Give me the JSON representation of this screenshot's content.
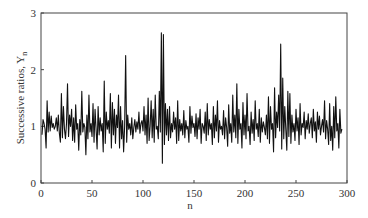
{
  "chart_data": {
    "type": "line",
    "title": "",
    "xlabel": "n",
    "ylabel": "Successive ratios, Y",
    "ylabel_subscript": "n",
    "xlim": [
      0,
      300
    ],
    "ylim": [
      0,
      3
    ],
    "xticks": [
      0,
      50,
      100,
      150,
      200,
      250,
      300
    ],
    "yticks": [
      0,
      1,
      2,
      3
    ],
    "grid": false,
    "legend": null,
    "series": [
      {
        "name": "Y_n",
        "color": "#111111",
        "x_start": 1,
        "x_step": 1,
        "values": [
          0.85,
          1.12,
          1.05,
          0.95,
          0.62,
          1.45,
          0.9,
          1.25,
          0.92,
          1.18,
          0.98,
          1.05,
          0.95,
          1.0,
          1.15,
          0.92,
          1.2,
          0.88,
          0.72,
          1.58,
          0.8,
          1.35,
          0.95,
          0.78,
          1.05,
          1.75,
          0.82,
          1.2,
          1.0,
          1.3,
          0.75,
          1.15,
          0.72,
          1.38,
          0.95,
          1.05,
          0.58,
          1.12,
          0.85,
          1.62,
          0.9,
          1.05,
          0.98,
          0.5,
          1.2,
          0.78,
          1.55,
          0.9,
          1.05,
          0.82,
          1.4,
          0.72,
          1.3,
          0.95,
          0.6,
          1.35,
          0.85,
          1.15,
          0.92,
          1.05,
          0.55,
          1.8,
          0.7,
          1.25,
          0.95,
          1.1,
          0.88,
          1.58,
          0.62,
          1.42,
          0.85,
          1.3,
          0.7,
          1.2,
          0.98,
          1.55,
          0.62,
          1.35,
          0.78,
          1.1,
          0.55,
          1.0,
          2.25,
          0.72,
          1.2,
          0.95,
          1.05,
          0.85,
          1.15,
          0.78,
          0.98,
          1.12,
          0.9,
          1.08,
          0.95,
          1.25,
          0.88,
          1.05,
          1.1,
          0.92,
          1.35,
          0.85,
          1.2,
          0.7,
          1.5,
          0.75,
          1.0,
          1.45,
          0.8,
          1.3,
          0.72,
          1.55,
          0.95,
          1.0,
          0.78,
          1.62,
          0.9,
          2.65,
          0.35,
          2.62,
          0.68,
          1.4,
          0.85,
          1.3,
          0.75,
          1.35,
          0.8,
          1.05,
          0.9,
          1.25,
          0.95,
          1.15,
          0.7,
          1.45,
          0.75,
          1.12,
          0.92,
          1.05,
          0.85,
          1.28,
          0.8,
          1.1,
          0.95,
          1.0,
          0.72,
          1.35,
          0.88,
          1.18,
          0.98,
          1.05,
          0.82,
          1.22,
          0.78,
          1.15,
          0.95,
          1.3,
          0.7,
          1.05,
          1.0,
          0.88,
          1.25,
          0.75,
          1.4,
          0.85,
          1.12,
          0.95,
          1.05,
          0.68,
          1.35,
          0.8,
          1.2,
          0.92,
          1.45,
          0.72,
          1.1,
          0.95,
          1.0,
          0.85,
          1.28,
          0.78,
          1.15,
          0.98,
          0.65,
          1.38,
          0.88,
          1.05,
          0.72,
          1.55,
          0.9,
          1.2,
          0.8,
          1.75,
          0.7,
          1.3,
          0.95,
          1.05,
          0.62,
          1.42,
          0.85,
          1.2,
          0.78,
          1.58,
          0.92,
          1.0,
          0.68,
          1.25,
          0.88,
          1.12,
          0.75,
          1.45,
          0.95,
          1.05,
          0.82,
          1.3,
          0.72,
          1.15,
          0.9,
          1.08,
          0.98,
          0.85,
          1.2,
          0.78,
          1.52,
          0.7,
          1.35,
          0.95,
          1.05,
          0.55,
          1.68,
          0.8,
          1.25,
          0.98,
          1.55,
          0.92,
          2.45,
          0.6,
          1.85,
          0.78,
          1.35,
          0.95,
          0.58,
          1.62,
          0.82,
          1.58,
          0.7,
          1.2,
          0.9,
          1.05,
          0.75,
          1.3,
          0.92,
          1.15,
          0.68,
          1.4,
          0.85,
          1.05,
          0.98,
          1.25,
          0.78,
          1.1,
          0.95,
          1.22,
          0.88,
          1.05,
          1.15,
          0.8,
          1.3,
          0.92,
          1.08,
          0.72,
          1.25,
          0.95,
          1.18,
          0.85,
          1.0,
          1.12,
          0.9,
          1.45,
          0.78,
          1.1,
          0.95,
          0.68,
          1.4,
          0.75,
          1.0,
          0.58,
          1.35,
          0.8,
          1.52,
          0.92,
          1.05,
          0.62,
          1.3,
          0.88,
          0.95
        ]
      }
    ]
  }
}
